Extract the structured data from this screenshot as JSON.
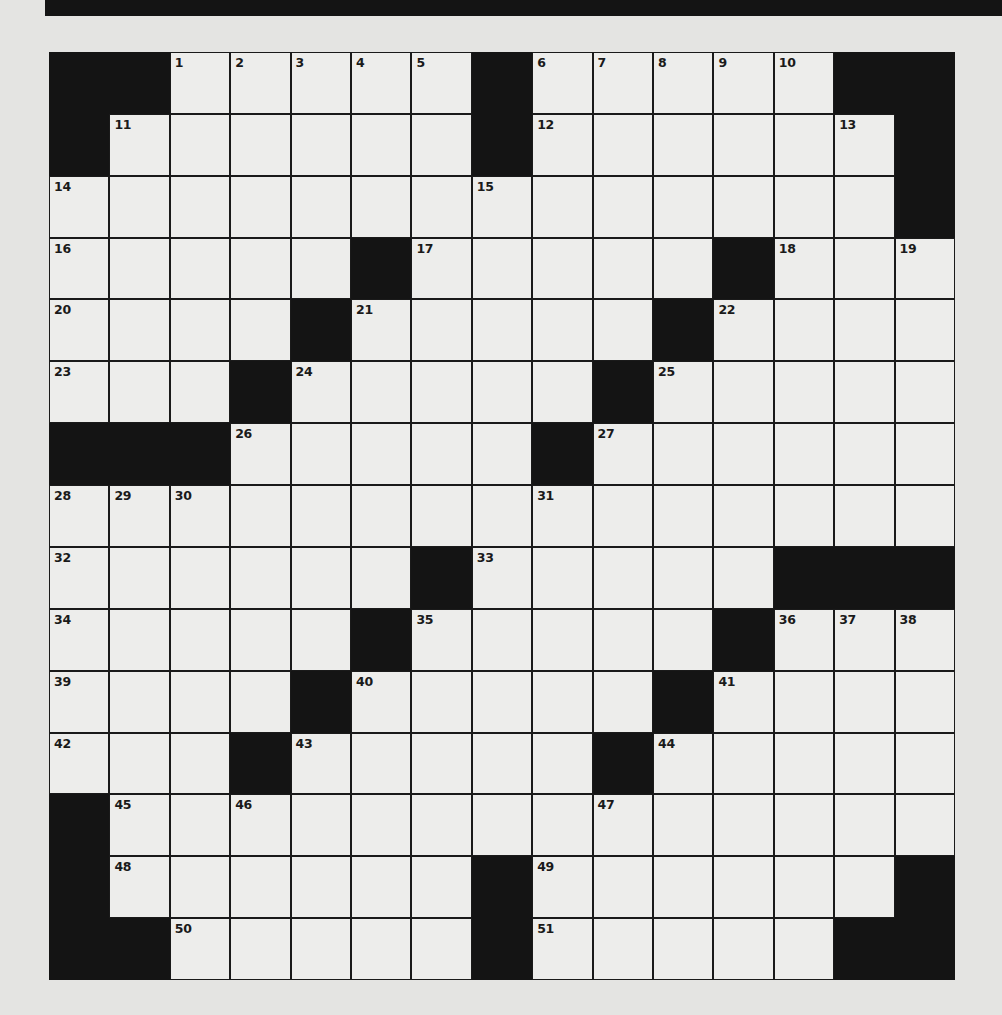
{
  "puzzle": {
    "rows": 15,
    "cols": 15,
    "colors": {
      "block": "#141414",
      "cell": "#ededeb",
      "background": "#e4e4e2",
      "line": "#1a1a1a"
    },
    "layout": [
      "##.....#.....##",
      "#......#......#",
      "..............#",
      ".....#.....#...",
      "....#.....#....",
      "...#.....#.....",
      "###.....#......",
      "...............",
      "......#.....###",
      ".....#.....#...",
      "....#.....#....",
      "...#.....#.....",
      "#..............",
      "#......#......#",
      "##.....#.....##"
    ],
    "numbers": [
      {
        "r": 0,
        "c": 2,
        "n": "1"
      },
      {
        "r": 0,
        "c": 3,
        "n": "2"
      },
      {
        "r": 0,
        "c": 4,
        "n": "3"
      },
      {
        "r": 0,
        "c": 5,
        "n": "4"
      },
      {
        "r": 0,
        "c": 6,
        "n": "5"
      },
      {
        "r": 0,
        "c": 8,
        "n": "6"
      },
      {
        "r": 0,
        "c": 9,
        "n": "7"
      },
      {
        "r": 0,
        "c": 10,
        "n": "8"
      },
      {
        "r": 0,
        "c": 11,
        "n": "9"
      },
      {
        "r": 0,
        "c": 12,
        "n": "10"
      },
      {
        "r": 1,
        "c": 1,
        "n": "11"
      },
      {
        "r": 1,
        "c": 8,
        "n": "12"
      },
      {
        "r": 1,
        "c": 13,
        "n": "13"
      },
      {
        "r": 2,
        "c": 0,
        "n": "14"
      },
      {
        "r": 2,
        "c": 7,
        "n": "15"
      },
      {
        "r": 3,
        "c": 0,
        "n": "16"
      },
      {
        "r": 3,
        "c": 6,
        "n": "17"
      },
      {
        "r": 3,
        "c": 12,
        "n": "18"
      },
      {
        "r": 3,
        "c": 14,
        "n": "19"
      },
      {
        "r": 4,
        "c": 0,
        "n": "20"
      },
      {
        "r": 4,
        "c": 5,
        "n": "21"
      },
      {
        "r": 4,
        "c": 11,
        "n": "22"
      },
      {
        "r": 5,
        "c": 0,
        "n": "23"
      },
      {
        "r": 5,
        "c": 4,
        "n": "24"
      },
      {
        "r": 5,
        "c": 10,
        "n": "25"
      },
      {
        "r": 6,
        "c": 3,
        "n": "26"
      },
      {
        "r": 6,
        "c": 9,
        "n": "27"
      },
      {
        "r": 7,
        "c": 0,
        "n": "28"
      },
      {
        "r": 7,
        "c": 1,
        "n": "29"
      },
      {
        "r": 7,
        "c": 2,
        "n": "30"
      },
      {
        "r": 7,
        "c": 8,
        "n": "31"
      },
      {
        "r": 8,
        "c": 0,
        "n": "32"
      },
      {
        "r": 8,
        "c": 7,
        "n": "33"
      },
      {
        "r": 9,
        "c": 0,
        "n": "34"
      },
      {
        "r": 9,
        "c": 6,
        "n": "35"
      },
      {
        "r": 9,
        "c": 12,
        "n": "36"
      },
      {
        "r": 9,
        "c": 13,
        "n": "37"
      },
      {
        "r": 9,
        "c": 14,
        "n": "38"
      },
      {
        "r": 10,
        "c": 0,
        "n": "39"
      },
      {
        "r": 10,
        "c": 5,
        "n": "40"
      },
      {
        "r": 10,
        "c": 11,
        "n": "41"
      },
      {
        "r": 11,
        "c": 0,
        "n": "42"
      },
      {
        "r": 11,
        "c": 4,
        "n": "43"
      },
      {
        "r": 11,
        "c": 10,
        "n": "44"
      },
      {
        "r": 12,
        "c": 1,
        "n": "45"
      },
      {
        "r": 12,
        "c": 3,
        "n": "46"
      },
      {
        "r": 12,
        "c": 9,
        "n": "47"
      },
      {
        "r": 13,
        "c": 1,
        "n": "48"
      },
      {
        "r": 13,
        "c": 8,
        "n": "49"
      },
      {
        "r": 14,
        "c": 2,
        "n": "50"
      },
      {
        "r": 14,
        "c": 8,
        "n": "51"
      }
    ]
  }
}
